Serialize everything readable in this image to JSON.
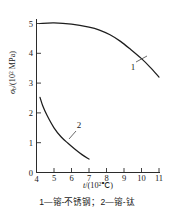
{
  "chart_data": {
    "type": "line",
    "title": "",
    "xlabel": "t /(10²℃)",
    "ylabel": "σb/(10² MPa)",
    "xlim": [
      4,
      11
    ],
    "ylim": [
      0,
      5.4
    ],
    "xticks": [
      4,
      5,
      6,
      7,
      8,
      9,
      10,
      11
    ],
    "xticklabels": [
      "4",
      "5",
      "6",
      "7",
      "8",
      "9",
      "10",
      "11"
    ],
    "yticks": [
      0,
      1,
      2,
      3,
      4,
      5
    ],
    "yticklabels": [
      "0",
      "1",
      "2",
      "3",
      "4",
      "5"
    ],
    "grid": false,
    "legend_position": "inline-annotations",
    "series": [
      {
        "name": "1",
        "label": "1",
        "description": "镕-不锈钢",
        "x": [
          4.2,
          5.0,
          6.0,
          7.0,
          7.6,
          8.2,
          8.8,
          9.4,
          10.0,
          10.5,
          11.0
        ],
        "y": [
          5.0,
          5.02,
          4.98,
          4.88,
          4.78,
          4.62,
          4.4,
          4.12,
          3.82,
          3.53,
          3.2
        ]
      },
      {
        "name": "2",
        "label": "2",
        "description": "镕-钛",
        "x": [
          4.2,
          4.35,
          4.6,
          5.0,
          5.4,
          5.8,
          6.2,
          6.6,
          7.0
        ],
        "y": [
          2.52,
          2.25,
          1.92,
          1.5,
          1.2,
          0.98,
          0.78,
          0.6,
          0.45
        ]
      }
    ],
    "annotations": [
      {
        "text": "1",
        "x": 9.6,
        "y": 4.05
      },
      {
        "text": "2",
        "x": 6.2,
        "y": 1.28
      }
    ]
  },
  "axis_titles": {
    "x_main": "t",
    "x_unit": "/(10",
    "x_exp": "2",
    "x_unit_tail": "℃)",
    "y_main": "σ",
    "y_sub": "b",
    "y_unit": "/(10",
    "y_exp": "2",
    "y_unit_tail": " MPa)"
  },
  "caption": {
    "text": "1—镕-不锈钢；2—镕-钛",
    "item1": "1—镕-不锈钢",
    "item2": "2—镕-钛"
  },
  "colors": {
    "curve": "#1d1d1d",
    "axis": "#2b2b2b",
    "background": "#ffffff",
    "text": "#1a1a1a"
  }
}
